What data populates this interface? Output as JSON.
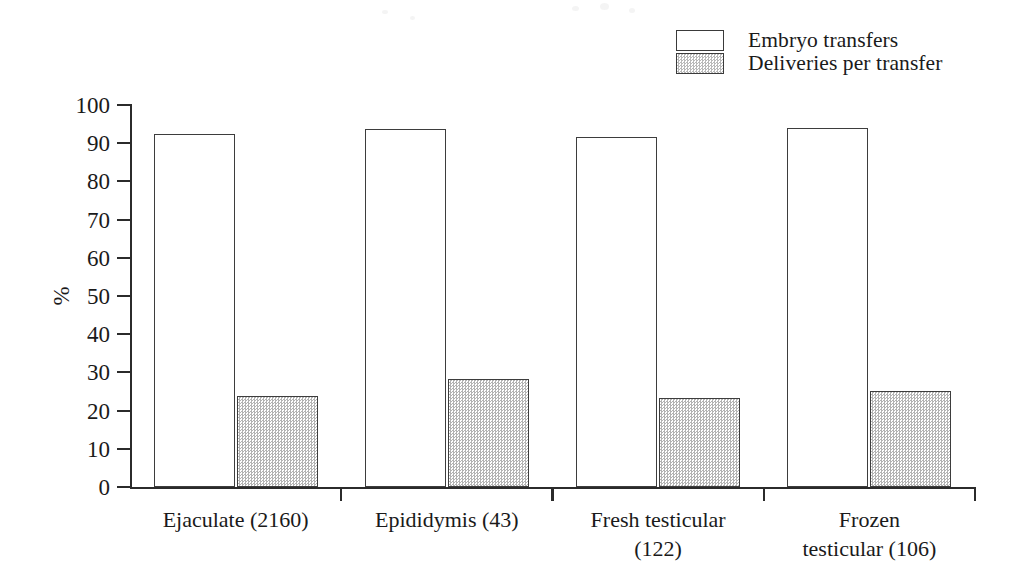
{
  "chart_data": {
    "type": "bar",
    "title": "",
    "xlabel": "",
    "ylabel": "%",
    "ylim": [
      0,
      100
    ],
    "grid": false,
    "legend_position": "top-right",
    "categories": [
      "Ejaculate (2160)",
      "Epididymis (43)",
      "Fresh testicular\n(122)",
      "Frozen\ntesticular (106)"
    ],
    "y_ticks": [
      0,
      10,
      20,
      30,
      40,
      50,
      60,
      70,
      80,
      90,
      100
    ],
    "y_tick_labels": [
      "0",
      "10",
      "20",
      "30",
      "40",
      "50",
      "60",
      "70",
      "80",
      "90",
      "100"
    ],
    "series": [
      {
        "name": "Embryo transfers",
        "swatch": "white",
        "fill": "#ffffff",
        "values": [
          92.3,
          93.6,
          91.7,
          94.0
        ]
      },
      {
        "name": "Deliveries per transfer",
        "swatch": "stipple",
        "fill": "#c8c8c8",
        "values": [
          23.8,
          28.2,
          23.2,
          25.1
        ]
      }
    ]
  },
  "legend": {
    "items": [
      {
        "label": "Embryo transfers",
        "swatch": "white"
      },
      {
        "label": "Deliveries per transfer",
        "swatch": "stipple"
      }
    ]
  },
  "axes": {
    "y_title": "%",
    "y_tick_labels": [
      "100",
      "90",
      "80",
      "70",
      "60",
      "50",
      "40",
      "30",
      "20",
      "10",
      "0"
    ]
  },
  "colors": {
    "ink": "#1a1a1a",
    "axis": "#2b2b2b",
    "bar_outline": "#3d3d3d",
    "series_embryo": "#ffffff",
    "series_deliveries": "#c8c8c8",
    "background": "#ffffff"
  }
}
